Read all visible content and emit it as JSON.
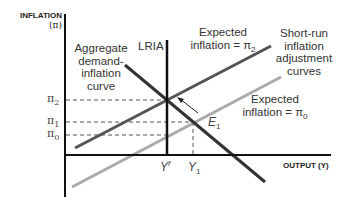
{
  "axes": {
    "y_label": "INFLATION",
    "y_symbol": "(π)",
    "x_label": "OUTPUT (Y)"
  },
  "ticks": {
    "pi2": {
      "base": "π",
      "sub": "2"
    },
    "pi1": {
      "base": "π",
      "sub": "1"
    },
    "pi0": {
      "base": "π",
      "sub": "0"
    },
    "yf": {
      "base": "Y",
      "sup": "f"
    },
    "y1": {
      "base": "Y",
      "sub": "1"
    }
  },
  "labels": {
    "lria": "LRIA",
    "ad_line1": "Aggregate",
    "ad_line2": "demand-",
    "ad_line3": "inflation",
    "ad_line4": "curve",
    "exp2_line1": "Expected",
    "exp2_line2": "inflation = π",
    "exp2_sub": "2",
    "sria_line1": "Short-run",
    "sria_line2": "inflation",
    "sria_line3": "adjustment",
    "sria_line4": "curves",
    "exp0_line1": "Expected",
    "exp0_line2": "inflation = π",
    "exp0_sub": "0",
    "e1": "E",
    "e1_sub": "1"
  },
  "colors": {
    "axis": "#111111",
    "ad_curve": "#333333",
    "sria_high": "#555555",
    "sria_low": "#aaaaaa",
    "dashed": "#555555"
  }
}
